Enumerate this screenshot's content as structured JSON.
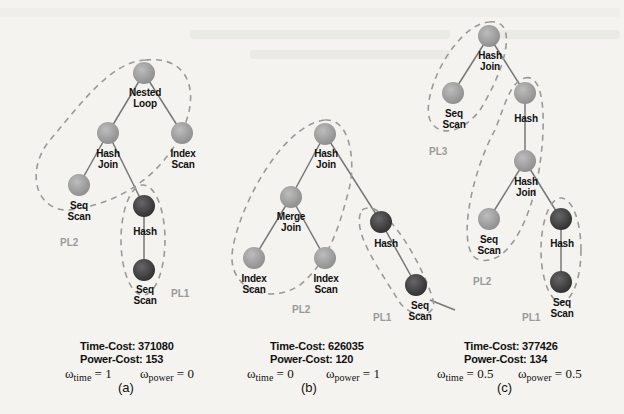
{
  "figure": {
    "panels": [
      {
        "id": "a",
        "caption": "(a)",
        "nodes": [
          {
            "label": "Nested\nLoop"
          },
          {
            "label": "Hash\nJoin"
          },
          {
            "label": "Index\nScan"
          },
          {
            "label": "Seq\nScan"
          },
          {
            "label": "Hash"
          },
          {
            "label": "Seq\nScan"
          }
        ],
        "pipelines": [
          "PL2",
          "PL1"
        ],
        "time_cost": "Time-Cost: 371080",
        "power_cost": "Power-Cost: 153",
        "omega_time": "= 1",
        "omega_power": "= 0"
      },
      {
        "id": "b",
        "caption": "(b)",
        "nodes": [
          {
            "label": "Hash\nJoin"
          },
          {
            "label": "Merge\nJoin"
          },
          {
            "label": "Index\nScan"
          },
          {
            "label": "Index\nScan"
          },
          {
            "label": "Hash"
          },
          {
            "label": "Seq\nScan"
          }
        ],
        "pipelines": [
          "PL2",
          "PL1"
        ],
        "time_cost": "Time-Cost: 626035",
        "power_cost": "Power-Cost: 120",
        "omega_time": "= 0",
        "omega_power": "= 1"
      },
      {
        "id": "c",
        "caption": "(c)",
        "nodes": [
          {
            "label": "Hash\nJoin"
          },
          {
            "label": "Seq\nScan"
          },
          {
            "label": "Hash"
          },
          {
            "label": "Hash\nJoin"
          },
          {
            "label": "Seq\nScan"
          },
          {
            "label": "Hash"
          },
          {
            "label": "Seq\nScan"
          }
        ],
        "pipelines": [
          "PL3",
          "PL2",
          "PL1"
        ],
        "time_cost": "Time-Cost: 377426",
        "power_cost": "Power-Cost: 134",
        "omega_time": "= 0.5",
        "omega_power": "= 0.5"
      }
    ],
    "omega_symbol": "ω",
    "omega_time_sub": "time",
    "omega_power_sub": "power",
    "colors": {
      "node_light": "#a8a8a8",
      "node_dark": "#444444",
      "edge": "#777777",
      "dash": "#9a9a9a",
      "pl_label": "#9a9a9a"
    }
  }
}
